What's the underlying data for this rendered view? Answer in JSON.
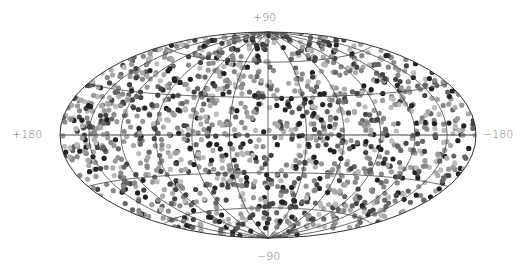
{
  "chart_data": {
    "type": "scatter",
    "projection": "hammer-aitoff (all-sky)",
    "title": "",
    "xlabel": "",
    "ylabel": "",
    "labels": {
      "top": "+90",
      "bottom": "−90",
      "left": "+180",
      "right": "−180"
    },
    "lon_range": [
      -180,
      180
    ],
    "lat_range": [
      -90,
      90
    ],
    "grid": {
      "meridians_deg": [
        -180,
        -150,
        -120,
        -90,
        -60,
        -30,
        0,
        30,
        60,
        90,
        120,
        150,
        180
      ],
      "parallels_deg": [
        -60,
        -30,
        0,
        30,
        60
      ],
      "color": "#444444"
    },
    "points": {
      "count": 1500,
      "distribution": "uniform on sphere",
      "radius_px": 2.6,
      "gray_palette": [
        "#222222",
        "#444444",
        "#666666",
        "#888888",
        "#999999",
        "#aaaaaa",
        "#bbbbbb"
      ],
      "seed": 1337
    },
    "legend": "none"
  },
  "layout": {
    "cx": 268,
    "cy": 135,
    "rx": 208,
    "ry": 103
  }
}
